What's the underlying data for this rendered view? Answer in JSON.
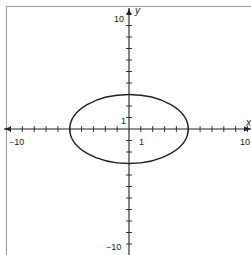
{
  "chart_data": {
    "type": "line",
    "title": "",
    "xlabel": "x",
    "ylabel": "y",
    "xlim": [
      -10,
      10
    ],
    "ylim": [
      -10,
      10
    ],
    "grid": false,
    "x_tick_labels": [
      "-10",
      "1",
      "10"
    ],
    "y_tick_labels": [
      "10",
      "1",
      "-10"
    ],
    "series": [
      {
        "name": "ellipse",
        "shape": "ellipse",
        "equation": "x^2/25 + y^2/9 = 1",
        "center": [
          0,
          0
        ],
        "semi_axis_x": 5,
        "semi_axis_y": 3,
        "x_intercepts": [
          -5,
          5
        ],
        "y_intercepts": [
          -3,
          3
        ]
      }
    ]
  },
  "labels": {
    "x_axis": "x",
    "y_axis": "y",
    "x_min": "−10",
    "x_max": "10",
    "x_unit": "1",
    "y_max": "10",
    "y_min": "−10",
    "y_unit": "1"
  },
  "colors": {
    "stroke": "#222222",
    "frame": "#888888",
    "background": "#ffffff"
  }
}
